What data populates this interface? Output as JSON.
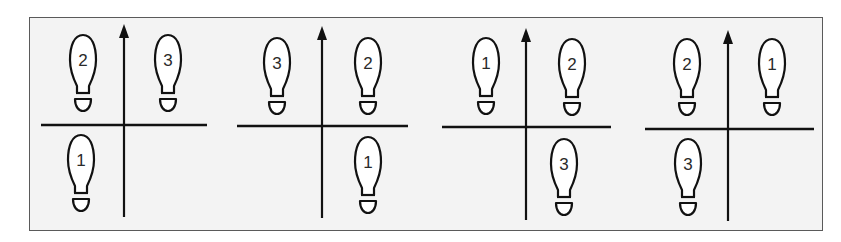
{
  "figure": {
    "colors": {
      "line": "#111111",
      "frame_border": "#5a5a5a",
      "frame_background": "#f3f3f3",
      "page_background": "#ffffff",
      "footprint_fill": "#ffffff"
    },
    "panels": [
      {
        "id": 1,
        "vertical_axis": {
          "x": 124,
          "y_top": 24,
          "y_bottom": 217
        },
        "horizontal_line": {
          "x1": 41,
          "x2": 207,
          "y": 125
        },
        "footprints": [
          {
            "label": "2",
            "x": 68,
            "y": 34,
            "quadrant": "top-left"
          },
          {
            "label": "3",
            "x": 153,
            "y": 34,
            "quadrant": "top-right"
          },
          {
            "label": "1",
            "x": 66,
            "y": 134,
            "quadrant": "bottom-left"
          }
        ]
      },
      {
        "id": 2,
        "vertical_axis": {
          "x": 322,
          "y_top": 26,
          "y_bottom": 218
        },
        "horizontal_line": {
          "x1": 237,
          "x2": 408,
          "y": 126
        },
        "footprints": [
          {
            "label": "3",
            "x": 262,
            "y": 37,
            "quadrant": "top-left"
          },
          {
            "label": "2",
            "x": 353,
            "y": 37,
            "quadrant": "top-right"
          },
          {
            "label": "1",
            "x": 353,
            "y": 136,
            "quadrant": "bottom-right"
          }
        ]
      },
      {
        "id": 3,
        "vertical_axis": {
          "x": 526,
          "y_top": 28,
          "y_bottom": 220
        },
        "horizontal_line": {
          "x1": 442,
          "x2": 611,
          "y": 127
        },
        "footprints": [
          {
            "label": "1",
            "x": 471,
            "y": 37,
            "quadrant": "top-left"
          },
          {
            "label": "2",
            "x": 557,
            "y": 38,
            "quadrant": "top-right"
          },
          {
            "label": "3",
            "x": 549,
            "y": 138,
            "quadrant": "bottom-right"
          }
        ]
      },
      {
        "id": 4,
        "vertical_axis": {
          "x": 728,
          "y_top": 30,
          "y_bottom": 221
        },
        "horizontal_line": {
          "x1": 645,
          "x2": 814,
          "y": 129
        },
        "footprints": [
          {
            "label": "2",
            "x": 672,
            "y": 38,
            "quadrant": "top-left"
          },
          {
            "label": "1",
            "x": 757,
            "y": 38,
            "quadrant": "top-right"
          },
          {
            "label": "3",
            "x": 673,
            "y": 138,
            "quadrant": "bottom-left"
          }
        ]
      }
    ]
  }
}
